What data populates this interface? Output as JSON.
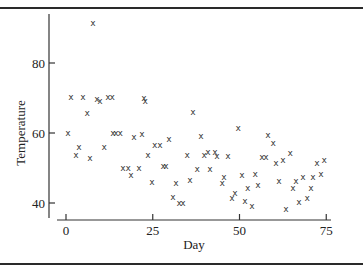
{
  "chart_data": {
    "type": "scatter",
    "title": "",
    "xlabel": "Day",
    "ylabel": "Temperature",
    "xlim": [
      -3,
      79
    ],
    "ylim": [
      36,
      95
    ],
    "xticks": [
      0,
      25,
      50,
      75
    ],
    "yticks": [
      40,
      60,
      80
    ],
    "grid": false,
    "legend": null,
    "marker": "x",
    "points": [
      [
        7.8,
        91.4
      ],
      [
        1.4,
        70.3
      ],
      [
        4.9,
        70.3
      ],
      [
        8.9,
        69.7
      ],
      [
        9.8,
        69.1
      ],
      [
        12.1,
        70.3
      ],
      [
        13.3,
        70.3
      ],
      [
        22.5,
        70.0
      ],
      [
        22.8,
        69.1
      ],
      [
        6.1,
        65.7
      ],
      [
        0.6,
        60.0
      ],
      [
        13.5,
        60.0
      ],
      [
        14.4,
        60.0
      ],
      [
        15.6,
        60.0
      ],
      [
        19.6,
        58.9
      ],
      [
        21.9,
        59.7
      ],
      [
        3.7,
        56.0
      ],
      [
        11.0,
        56.0
      ],
      [
        2.9,
        53.7
      ],
      [
        6.9,
        52.9
      ],
      [
        16.4,
        50.0
      ],
      [
        17.9,
        50.0
      ],
      [
        18.7,
        48.0
      ],
      [
        21.0,
        50.0
      ],
      [
        36.6,
        66.0
      ],
      [
        25.6,
        56.6
      ],
      [
        27.1,
        56.6
      ],
      [
        29.7,
        58.3
      ],
      [
        38.9,
        59.1
      ],
      [
        49.6,
        61.4
      ],
      [
        23.6,
        53.7
      ],
      [
        34.9,
        53.7
      ],
      [
        39.8,
        53.7
      ],
      [
        40.9,
        54.6
      ],
      [
        42.9,
        54.6
      ],
      [
        43.5,
        53.4
      ],
      [
        46.7,
        53.4
      ],
      [
        28.0,
        50.6
      ],
      [
        28.8,
        50.6
      ],
      [
        37.8,
        49.7
      ],
      [
        41.5,
        49.7
      ],
      [
        24.8,
        46.0
      ],
      [
        31.7,
        45.7
      ],
      [
        35.7,
        46.6
      ],
      [
        45.0,
        45.7
      ],
      [
        45.5,
        47.4
      ],
      [
        30.8,
        41.7
      ],
      [
        32.6,
        40.0
      ],
      [
        33.7,
        40.0
      ],
      [
        47.8,
        41.4
      ],
      [
        48.7,
        42.9
      ],
      [
        56.5,
        53.1
      ],
      [
        57.6,
        53.1
      ],
      [
        58.2,
        59.4
      ],
      [
        59.7,
        57.1
      ],
      [
        60.5,
        51.4
      ],
      [
        62.5,
        52.3
      ],
      [
        64.6,
        54.3
      ],
      [
        72.3,
        51.4
      ],
      [
        74.4,
        52.3
      ],
      [
        50.7,
        48.0
      ],
      [
        54.5,
        48.3
      ],
      [
        52.4,
        44.3
      ],
      [
        55.3,
        45.1
      ],
      [
        61.4,
        46.3
      ],
      [
        66.3,
        46.3
      ],
      [
        65.4,
        44.3
      ],
      [
        68.3,
        47.4
      ],
      [
        71.2,
        47.4
      ],
      [
        73.5,
        48.3
      ],
      [
        70.6,
        44.3
      ],
      [
        51.6,
        40.6
      ],
      [
        53.6,
        39.1
      ],
      [
        63.4,
        38.3
      ],
      [
        67.1,
        40.3
      ],
      [
        69.5,
        41.4
      ]
    ]
  }
}
